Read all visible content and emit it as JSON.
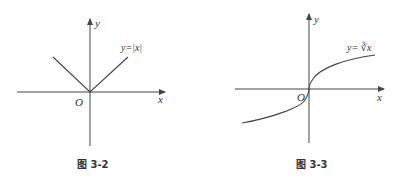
{
  "figures": [
    {
      "id": "fig-3-2",
      "caption": "图 3-2",
      "function_label": "y=|x|",
      "x_axis_label": "x",
      "y_axis_label": "y",
      "origin_label": "O"
    },
    {
      "id": "fig-3-3",
      "caption": "图 3-3",
      "function_label": "y= ∛x",
      "x_axis_label": "x",
      "y_axis_label": "y",
      "origin_label": "O"
    }
  ],
  "colors": {
    "stroke": "#444444",
    "text": "#333333",
    "background": "#ffffff"
  }
}
